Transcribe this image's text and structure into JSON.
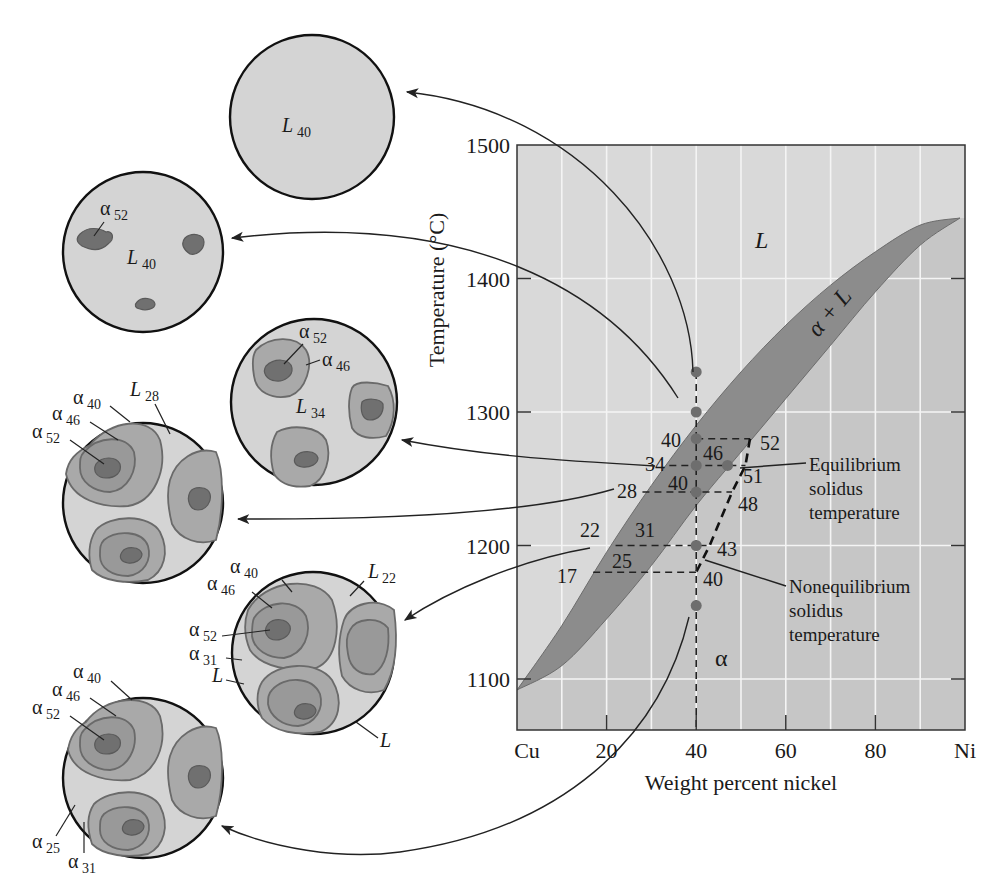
{
  "chart_data": {
    "type": "phase-diagram",
    "xlabel": "Weight percent nickel",
    "ylabel": "Temperature (°C)",
    "xlim": [
      0,
      100
    ],
    "ylim": [
      1063,
      1500
    ],
    "x_ticks": [
      {
        "value": 0,
        "label": "Cu"
      },
      {
        "value": 20,
        "label": "20"
      },
      {
        "value": 40,
        "label": "40"
      },
      {
        "value": 60,
        "label": "60"
      },
      {
        "value": 80,
        "label": "80"
      },
      {
        "value": 100,
        "label": "Ni"
      }
    ],
    "y_ticks": [
      {
        "value": 1500,
        "label": "1500"
      },
      {
        "value": 1400,
        "label": "1400"
      },
      {
        "value": 1300,
        "label": "1300"
      },
      {
        "value": 1200,
        "label": "1200"
      },
      {
        "value": 1100,
        "label": "1100"
      }
    ],
    "grid": {
      "x_step": 10,
      "y_step": 100
    },
    "regions": [
      {
        "name": "liquid",
        "label": "L"
      },
      {
        "name": "two-phase",
        "label": "α + L"
      },
      {
        "name": "solid",
        "label": "α"
      }
    ],
    "liquidus": [
      [
        0,
        1085
      ],
      [
        10,
        1140
      ],
      [
        20,
        1195
      ],
      [
        30,
        1245
      ],
      [
        40,
        1290
      ],
      [
        50,
        1330
      ],
      [
        60,
        1365
      ],
      [
        70,
        1395
      ],
      [
        80,
        1420
      ],
      [
        90,
        1440
      ],
      [
        100,
        1455
      ]
    ],
    "solidus": [
      [
        0,
        1085
      ],
      [
        10,
        1110
      ],
      [
        20,
        1145
      ],
      [
        30,
        1185
      ],
      [
        40,
        1230
      ],
      [
        50,
        1270
      ],
      [
        60,
        1310
      ],
      [
        70,
        1350
      ],
      [
        80,
        1390
      ],
      [
        90,
        1425
      ],
      [
        100,
        1455
      ]
    ],
    "alloy_composition": 40,
    "cooling_points_temp": [
      1330,
      1300,
      1280,
      1260,
      1240,
      1200,
      1155
    ],
    "tie_lines": [
      {
        "temp": 1280,
        "liquid": 40,
        "solid": 52,
        "labels": {
          "liquid": "40",
          "solid": "52"
        }
      },
      {
        "temp": 1260,
        "liquid": 34,
        "solid": 46,
        "labels": {
          "liquid": "34",
          "solid": "46",
          "avg": "51"
        }
      },
      {
        "temp": 1240,
        "liquid": 28,
        "solid": 40,
        "labels": {
          "liquid": "28",
          "solid": "40",
          "avg": "48"
        }
      },
      {
        "temp": 1200,
        "liquid": 22,
        "solid": 31,
        "labels": {
          "liquid": "22",
          "solid": "31",
          "avg": "43"
        }
      },
      {
        "temp": 1180,
        "liquid": 17,
        "solid": 25,
        "labels": {
          "liquid": "17",
          "solid": "25",
          "avg": "40"
        }
      }
    ],
    "nonequilibrium_solidus": [
      [
        52,
        1280
      ],
      [
        51,
        1260
      ],
      [
        48,
        1240
      ],
      [
        43,
        1200
      ],
      [
        40,
        1180
      ]
    ],
    "annotations": [
      {
        "text": [
          "Equilibrium",
          "solidus",
          "temperature"
        ],
        "points_to": [
          51,
          1260
        ]
      },
      {
        "text": [
          "Nonequilibrium",
          "solidus",
          "temperature"
        ],
        "points_to": [
          40,
          1180
        ]
      }
    ]
  },
  "microstructures": [
    {
      "id": "m1",
      "label": "L",
      "sub": "40"
    },
    {
      "id": "m2",
      "labels": [
        {
          "t": "α",
          "s": "52"
        },
        {
          "t": "L",
          "s": "40"
        }
      ]
    },
    {
      "id": "m3",
      "labels": [
        {
          "t": "α",
          "s": "52"
        },
        {
          "t": "α",
          "s": "46"
        },
        {
          "t": "L",
          "s": "34"
        }
      ]
    },
    {
      "id": "m4",
      "labels": [
        {
          "t": "α",
          "s": "40"
        },
        {
          "t": "α",
          "s": "46"
        },
        {
          "t": "α",
          "s": "52"
        },
        {
          "t": "L",
          "s": "28"
        }
      ]
    },
    {
      "id": "m5",
      "labels": [
        {
          "t": "α",
          "s": "40"
        },
        {
          "t": "α",
          "s": "46"
        },
        {
          "t": "α",
          "s": "52"
        },
        {
          "t": "α",
          "s": "31"
        },
        {
          "t": "L",
          "s": ""
        },
        {
          "t": "L",
          "s": ""
        },
        {
          "t": "L",
          "s": "22"
        }
      ]
    },
    {
      "id": "m6",
      "labels": [
        {
          "t": "α",
          "s": "40"
        },
        {
          "t": "α",
          "s": "46"
        },
        {
          "t": "α",
          "s": "52"
        },
        {
          "t": "α",
          "s": "25"
        },
        {
          "t": "α",
          "s": "31"
        }
      ]
    }
  ],
  "colors": {
    "liquid_region": "#d9d9d9",
    "solid_region": "#c6c6c6",
    "two_phase_band": "#8c8c8c",
    "grid": "#f4f4f4",
    "dot": "#6e6e6e",
    "line": "#222222",
    "micro_matrix": "#d4d4d4",
    "micro_outer": "#a9a9a9",
    "micro_mid": "#999999",
    "micro_core": "#707070"
  }
}
